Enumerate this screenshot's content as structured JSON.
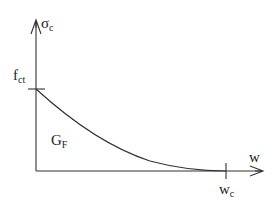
{
  "diagram": {
    "type": "softening-curve",
    "colors": {
      "line": "#333333",
      "text": "#222222",
      "background": "#ffffff"
    },
    "axes": {
      "y": {
        "symbol": "σ",
        "subscript": "c"
      },
      "x": {
        "symbol": "w",
        "subscript": ""
      }
    },
    "ticks": {
      "y_tick": {
        "symbol": "f",
        "subscript": "ct"
      },
      "x_tick": {
        "symbol": "w",
        "subscript": "c"
      }
    },
    "area_label": {
      "symbol": "G",
      "subscript": "F"
    },
    "geometry": {
      "origin": [
        36,
        171
      ],
      "y_axis_top": 20,
      "x_axis_right": 263,
      "fct_y": 89,
      "wc_x": 226
    }
  }
}
